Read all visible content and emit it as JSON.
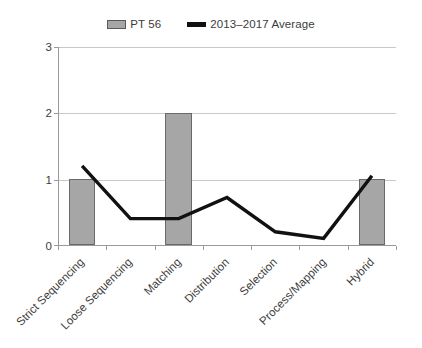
{
  "chart_data": {
    "type": "bar",
    "title": "",
    "xlabel": "",
    "ylabel": "",
    "ylim": [
      0,
      3
    ],
    "yticks": [
      0,
      1,
      2,
      3
    ],
    "grid": true,
    "legend_position": "top-center",
    "categories": [
      "Strict Sequencing",
      "Loose Sequencing",
      "Matching",
      "Distribution",
      "Selection",
      "Process/Mapping",
      "Hybrid"
    ],
    "series": [
      {
        "name": "PT 56",
        "type": "bar",
        "color": "#a6a6a6",
        "values": [
          1,
          0,
          2,
          0,
          0,
          0,
          1
        ]
      },
      {
        "name": "2013–2017 Average",
        "type": "line",
        "color": "#111111",
        "values": [
          1.2,
          0.4,
          0.4,
          0.72,
          0.2,
          0.1,
          1.05
        ]
      }
    ]
  },
  "legend": {
    "items": [
      {
        "label": "PT 56",
        "swatch": "bar-swatch-icon"
      },
      {
        "label": "2013–2017 Average",
        "swatch": "line-swatch-icon"
      }
    ]
  },
  "axes": {
    "y_tick_labels": [
      "3",
      "2",
      "1",
      "0"
    ]
  }
}
